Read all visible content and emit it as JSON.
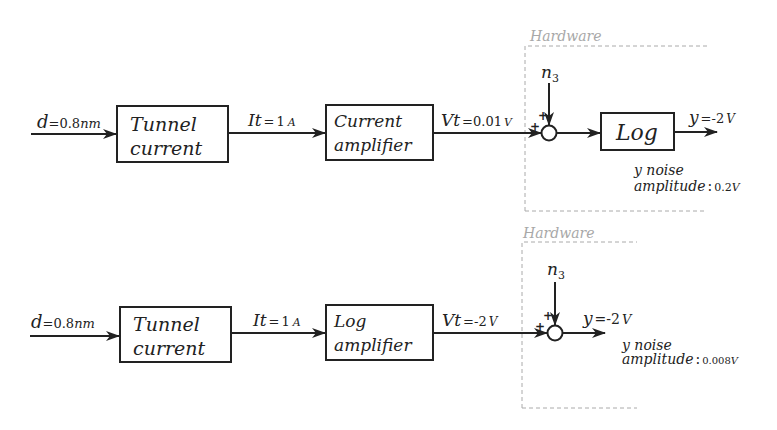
{
  "diagram": {
    "type": "block-diagram",
    "colors": {
      "line": "#222222",
      "hardware_box": "#aaaaaa",
      "hardware_label": "#a8a8a8"
    },
    "top": {
      "input": {
        "var": "d",
        "eq": "=",
        "value": "0.8",
        "unit": "nm"
      },
      "block1": {
        "line1": "Tunnel",
        "line2": "current"
      },
      "signal1": {
        "var": "It",
        "eq": "=",
        "value": "1",
        "unit": "A"
      },
      "block2": {
        "line1": "Current",
        "line2": "amplifier"
      },
      "signal2": {
        "var": "Vt",
        "eq": "=",
        "value": "0.01",
        "unit": "V"
      },
      "hardware_label": "Hardware",
      "noise": {
        "symbol": "n",
        "subscript": "3"
      },
      "sum_signs": {
        "left": "+",
        "top": "+"
      },
      "block3": {
        "label": "Log"
      },
      "output": {
        "var": "y",
        "eq": "=",
        "value": "-2",
        "unit": "V"
      },
      "noise_note": {
        "line1": "y noise",
        "line2": "amplitude",
        "sep": ":",
        "value": "0.2",
        "unit": "V"
      }
    },
    "bottom": {
      "input": {
        "var": "d",
        "eq": "=",
        "value": "0.8",
        "unit": "nm"
      },
      "block1": {
        "line1": "Tunnel",
        "line2": "current"
      },
      "signal1": {
        "var": "It",
        "eq": "=",
        "value": "1",
        "unit": "A"
      },
      "block2": {
        "line1": "Log",
        "line2": "amplifier"
      },
      "signal2": {
        "var": "Vt",
        "eq": "=",
        "value": "-2",
        "unit": "V"
      },
      "hardware_label": "Hardware",
      "noise": {
        "symbol": "n",
        "subscript": "3"
      },
      "sum_signs": {
        "left": "+",
        "top": "+"
      },
      "output": {
        "var": "y",
        "eq": "=",
        "value": "-2",
        "unit": "V"
      },
      "noise_note": {
        "line1": "y noise",
        "line2": "amplitude",
        "sep": ":",
        "value": "0.008",
        "unit": "V"
      }
    }
  }
}
